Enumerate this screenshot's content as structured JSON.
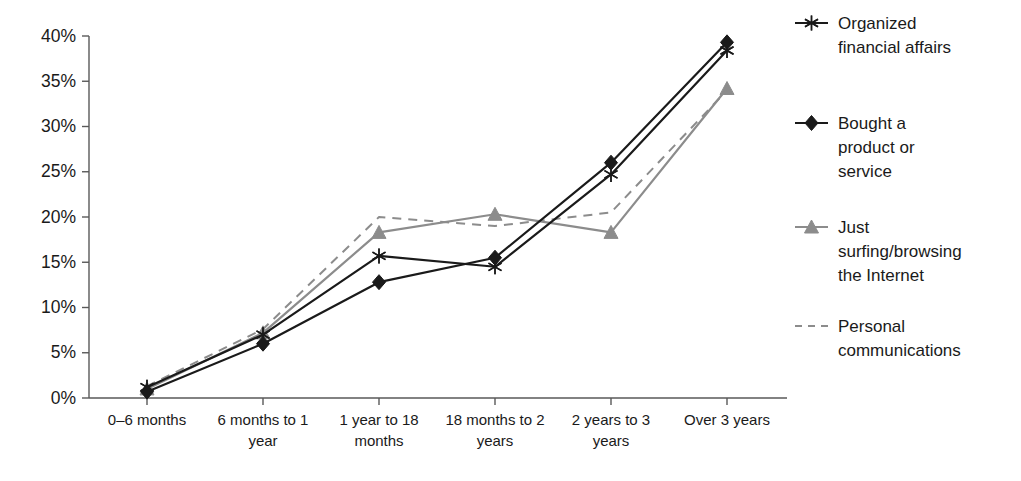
{
  "chart_data": {
    "type": "line",
    "title": "",
    "subtitle": "",
    "xlabel": "",
    "ylabel": "",
    "ylim": [
      0,
      40
    ],
    "ytick_labels": [
      "0%",
      "5%",
      "10%",
      "15%",
      "20%",
      "25%",
      "30%",
      "35%",
      "40%"
    ],
    "ytick_values": [
      0,
      5,
      10,
      15,
      20,
      25,
      30,
      35,
      40
    ],
    "grid": false,
    "legend_position": "right",
    "categories": [
      "0–6 months",
      "6 months to 1 year",
      "1 year to 18 months",
      "18 months to 2 years",
      "2 years to 3 years",
      "Over 3 years"
    ],
    "series": [
      {
        "name": "Organized financial affairs",
        "marker": "asterisk",
        "line_style": "solid",
        "color": "#1a1a1a",
        "values": [
          1.2,
          7.0,
          15.7,
          14.5,
          24.7,
          38.4
        ]
      },
      {
        "name": "Bought a product or service",
        "marker": "diamond",
        "line_style": "solid",
        "color": "#1a1a1a",
        "values": [
          0.7,
          6.0,
          12.8,
          15.5,
          26.0,
          39.3
        ]
      },
      {
        "name": "Just surfing/browsing the Internet",
        "marker": "triangle",
        "line_style": "solid",
        "color": "#8c8c8c",
        "values": [
          1.0,
          7.2,
          18.3,
          20.3,
          18.3,
          34.2
        ]
      },
      {
        "name": "Personal communications",
        "marker": "none",
        "line_style": "dashed",
        "color": "#8c8c8c",
        "values": [
          1.3,
          7.6,
          20.0,
          19.0,
          20.5,
          34.0
        ]
      }
    ]
  },
  "legend": {
    "items": [
      {
        "label_lines": [
          "Organized",
          "financial affairs"
        ],
        "marker": "asterisk-marker",
        "swatch_name": "legend-swatch-organized-financial-affairs"
      },
      {
        "label_lines": [
          "Bought a",
          "product or",
          "service"
        ],
        "marker": "diamond-marker",
        "swatch_name": "legend-swatch-bought-a-product-or-service"
      },
      {
        "label_lines": [
          "Just",
          "surfing/browsing",
          "the Internet"
        ],
        "marker": "triangle-marker",
        "swatch_name": "legend-swatch-just-surfing-browsing-the-internet"
      },
      {
        "label_lines": [
          "Personal",
          "communications"
        ],
        "marker": "dashed-line",
        "swatch_name": "legend-swatch-personal-communications"
      }
    ]
  },
  "colors": {
    "dark_series": "#1a1a1a",
    "gray_series": "#8c8c8c",
    "axis": "#595959",
    "background": "#ffffff"
  }
}
